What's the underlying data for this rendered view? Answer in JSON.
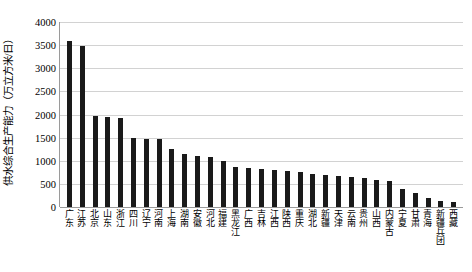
{
  "chart_data": {
    "type": "bar",
    "title": "",
    "xlabel": "",
    "ylabel": "供水综合生产能力（万立方米/日）",
    "ylim": [
      0,
      4000
    ],
    "grid": true,
    "legend": "none",
    "y_ticks": [
      0,
      500,
      1000,
      1500,
      2000,
      2500,
      3000,
      3500,
      4000
    ],
    "y_tick_labels": [
      "0",
      "500",
      "1000",
      "1500",
      "2000",
      "2500",
      "3000",
      "3500",
      "4000"
    ],
    "categories": [
      "广东",
      "江苏",
      "北京",
      "山东",
      "浙江",
      "四川",
      "辽宁",
      "河南",
      "上海",
      "湖南",
      "安徽",
      "河北",
      "福建",
      "黑龙江",
      "广西",
      "吉林",
      "江西",
      "陕西",
      "重庆",
      "湖北",
      "新疆",
      "天津",
      "云南",
      "贵州",
      "山西",
      "内蒙古",
      "宁夏",
      "甘肃",
      "青海",
      "新疆兵团",
      "西藏"
    ],
    "values": [
      3600,
      3480,
      1960,
      1940,
      1920,
      1500,
      1470,
      1460,
      1250,
      1150,
      1100,
      1080,
      1000,
      860,
      840,
      820,
      790,
      770,
      750,
      720,
      700,
      680,
      650,
      620,
      590,
      560,
      400,
      300,
      200,
      130,
      110
    ],
    "bar_color": "#1a1a1a",
    "grid_color": "#d2d2d2",
    "axis_color": "#9a9a9a",
    "background_color": "#ffffff"
  }
}
